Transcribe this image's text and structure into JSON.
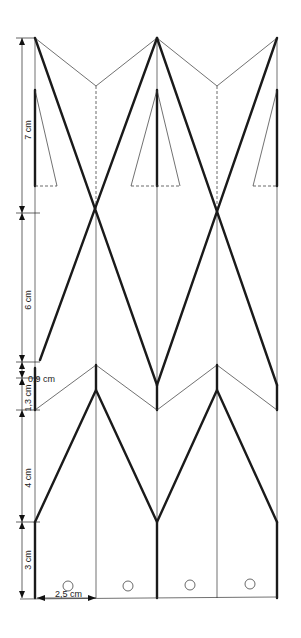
{
  "diagram": {
    "type": "folding-template",
    "dimensions": [
      {
        "label": "7 cm",
        "axis": "vertical"
      },
      {
        "label": "6 cm",
        "axis": "vertical"
      },
      {
        "label": "0,9 cm",
        "axis": "vertical"
      },
      {
        "label": "1,3 cm",
        "axis": "vertical"
      },
      {
        "label": "4 cm",
        "axis": "vertical"
      },
      {
        "label": "3 cm",
        "axis": "vertical"
      },
      {
        "label": "2,5 cm",
        "axis": "horizontal"
      }
    ],
    "columns": 4,
    "holes": 4,
    "colors": {
      "line": "#1a1a1a",
      "background": "#ffffff"
    }
  }
}
